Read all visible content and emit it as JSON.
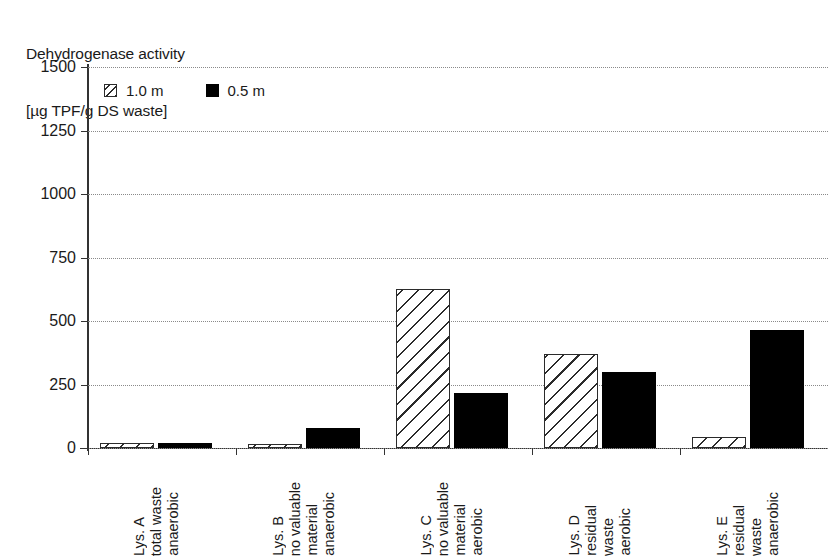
{
  "chart_data": {
    "type": "bar",
    "title": "Dehydrogenase activity [µg TPF/g DS waste]",
    "title_lines": [
      "Dehydrogenase activity",
      "[µg TPF/g DS waste]"
    ],
    "xlabel": "",
    "ylabel": "Dehydrogenase activity [µg TPF/g DS waste]",
    "ylim": [
      0,
      1500
    ],
    "ytick_values": [
      0,
      250,
      500,
      750,
      1000,
      1250,
      1500
    ],
    "ytick_labels": [
      "0",
      "250",
      "500",
      "750",
      "1000",
      "1250",
      "1500"
    ],
    "grid": true,
    "grid_style": "dotted-horizontal",
    "legend_position": "top-left-inside",
    "categories": [
      "Lys. A total waste anaerobic",
      "Lys. B no valuable material anaerobic",
      "Lys. C no valuable material aerobic",
      "Lys. D residual waste aerobic",
      "Lys. E residual waste anaerobic"
    ],
    "category_lines": [
      [
        "Lys. A",
        "total waste",
        "anaerobic"
      ],
      [
        "Lys. B",
        "no valuable",
        "material",
        "anaerobic"
      ],
      [
        "Lys. C",
        "no valuable",
        "material",
        "aerobic"
      ],
      [
        "Lys. D",
        "residual",
        "waste",
        "aerobic"
      ],
      [
        "Lys. E",
        "residual",
        "waste",
        "anaerobic"
      ]
    ],
    "series": [
      {
        "name": "1.0 m",
        "pattern": "hatched",
        "color": "#ffffff",
        "edge_color": "#2b2b2b",
        "values": [
          20,
          15,
          625,
          370,
          45
        ]
      },
      {
        "name": "0.5 m",
        "pattern": "solid",
        "color": "#000000",
        "edge_color": "#000000",
        "values": [
          18,
          78,
          218,
          300,
          465
        ]
      }
    ]
  },
  "legend": {
    "items": [
      {
        "label": "1.0 m",
        "swatch": "hatched-square-icon"
      },
      {
        "label": "0.5 m",
        "swatch": "solid-square-icon"
      }
    ]
  }
}
